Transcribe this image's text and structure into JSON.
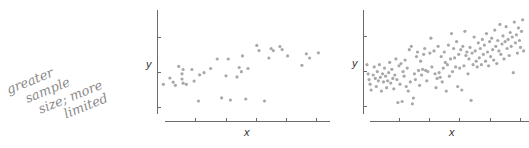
{
  "annotation": {
    "lines": [
      "greater",
      "sample",
      "size; more",
      "limited"
    ],
    "color": "#8a8a8a"
  },
  "point_color": "#a8a8a8",
  "axis_color": "#6b6b6b",
  "chart_data": [
    {
      "type": "scatter",
      "title": "",
      "xlabel": "x",
      "ylabel": "y",
      "grid": false,
      "legend": "none",
      "description": "smaller sample, weak positive relationship",
      "x_ticks": 5,
      "y_ticks": 3,
      "xlim": [
        0,
        10
      ],
      "ylim": [
        0,
        10
      ],
      "points": [
        [
          0.3,
          3.5
        ],
        [
          0.9,
          4.1
        ],
        [
          1.2,
          3.7
        ],
        [
          1.4,
          3.4
        ],
        [
          1.7,
          5.2
        ],
        [
          2.0,
          4.0
        ],
        [
          2.0,
          4.5
        ],
        [
          2.1,
          3.6
        ],
        [
          2.1,
          4.9
        ],
        [
          2.4,
          3.5
        ],
        [
          2.9,
          4.9
        ],
        [
          3.1,
          3.8
        ],
        [
          3.5,
          1.9
        ],
        [
          3.6,
          4.4
        ],
        [
          4.0,
          4.6
        ],
        [
          4.6,
          5.0
        ],
        [
          5.2,
          5.9
        ],
        [
          5.6,
          2.2
        ],
        [
          6.0,
          4.3
        ],
        [
          6.2,
          5.9
        ],
        [
          6.4,
          2.0
        ],
        [
          7.0,
          4.2
        ],
        [
          7.2,
          5.1
        ],
        [
          7.4,
          4.7
        ],
        [
          7.5,
          6.2
        ],
        [
          7.8,
          2.1
        ],
        [
          8.0,
          5.0
        ],
        [
          8.8,
          7.2
        ],
        [
          9.0,
          6.7
        ],
        [
          9.5,
          1.9
        ],
        [
          9.9,
          6.0
        ],
        [
          10.1,
          6.9
        ],
        [
          10.3,
          6.7
        ],
        [
          10.9,
          7.1
        ],
        [
          11.1,
          6.8
        ],
        [
          11.6,
          6.2
        ],
        [
          12.9,
          5.3
        ],
        [
          13.3,
          6.4
        ],
        [
          13.6,
          6.0
        ],
        [
          14.4,
          6.5
        ]
      ]
    },
    {
      "type": "scatter",
      "title": "",
      "xlabel": "x",
      "ylabel": "y",
      "grid": false,
      "legend": "none",
      "description": "larger sample, clearer positive relationship",
      "x_ticks": 5,
      "y_ticks": 3,
      "xlim": [
        0,
        10
      ],
      "ylim": [
        0,
        10
      ],
      "points": [
        [
          0.1,
          4.9
        ],
        [
          0.2,
          4.1
        ],
        [
          0.3,
          3.6
        ],
        [
          0.4,
          3.2
        ],
        [
          0.5,
          2.7
        ],
        [
          0.7,
          4.0
        ],
        [
          0.8,
          4.7
        ],
        [
          0.9,
          3.7
        ],
        [
          1.0,
          3.0
        ],
        [
          1.1,
          4.3
        ],
        [
          1.2,
          3.5
        ],
        [
          1.3,
          4.9
        ],
        [
          1.4,
          3.8
        ],
        [
          1.5,
          2.6
        ],
        [
          1.6,
          4.1
        ],
        [
          1.7,
          3.4
        ],
        [
          1.8,
          4.6
        ],
        [
          1.9,
          3.9
        ],
        [
          2.0,
          2.9
        ],
        [
          2.1,
          3.5
        ],
        [
          2.2,
          4.2
        ],
        [
          2.3,
          5.1
        ],
        [
          2.4,
          3.3
        ],
        [
          2.5,
          4.5
        ],
        [
          2.6,
          3.7
        ],
        [
          2.7,
          2.8
        ],
        [
          2.8,
          4.0
        ],
        [
          2.9,
          5.4
        ],
        [
          3.0,
          3.6
        ],
        [
          3.1,
          1.6
        ],
        [
          3.2,
          4.8
        ],
        [
          3.3,
          3.2
        ],
        [
          3.4,
          5.0
        ],
        [
          3.5,
          1.7
        ],
        [
          3.6,
          4.3
        ],
        [
          3.7,
          3.9
        ],
        [
          3.8,
          5.3
        ],
        [
          3.9,
          3.0
        ],
        [
          4.0,
          4.6
        ],
        [
          4.1,
          2.6
        ],
        [
          4.2,
          6.2
        ],
        [
          4.3,
          3.4
        ],
        [
          4.4,
          6.5
        ],
        [
          4.5,
          1.5
        ],
        [
          4.6,
          2.0
        ],
        [
          4.7,
          4.1
        ],
        [
          4.8,
          3.6
        ],
        [
          4.9,
          5.6
        ],
        [
          5.0,
          6.0
        ],
        [
          5.1,
          4.4
        ],
        [
          5.2,
          3.1
        ],
        [
          5.3,
          5.2
        ],
        [
          5.4,
          4.0
        ],
        [
          5.5,
          4.5
        ],
        [
          5.6,
          5.8
        ],
        [
          5.7,
          6.3
        ],
        [
          5.8,
          4.4
        ],
        [
          5.9,
          3.5
        ],
        [
          6.0,
          4.3
        ],
        [
          6.2,
          5.9
        ],
        [
          6.3,
          7.2
        ],
        [
          6.4,
          4.7
        ],
        [
          6.6,
          6.1
        ],
        [
          6.7,
          4.1
        ],
        [
          6.8,
          2.9
        ],
        [
          6.9,
          3.7
        ],
        [
          7.0,
          6.5
        ],
        [
          7.1,
          4.2
        ],
        [
          7.2,
          3.8
        ],
        [
          7.3,
          5.6
        ],
        [
          7.4,
          3.4
        ],
        [
          7.5,
          4.6
        ],
        [
          7.6,
          6.0
        ],
        [
          7.7,
          5.1
        ],
        [
          7.8,
          2.6
        ],
        [
          7.9,
          4.9
        ],
        [
          8.0,
          6.6
        ],
        [
          8.1,
          3.9
        ],
        [
          8.2,
          5.4
        ],
        [
          8.3,
          7.6
        ],
        [
          8.4,
          4.3
        ],
        [
          8.5,
          6.3
        ],
        [
          8.6,
          5.5
        ],
        [
          8.7,
          4.7
        ],
        [
          8.8,
          6.9
        ],
        [
          8.9,
          3.0
        ],
        [
          9.0,
          5.8
        ],
        [
          9.1,
          4.6
        ],
        [
          9.2,
          6.2
        ],
        [
          9.3,
          2.7
        ],
        [
          9.4,
          6.5
        ],
        [
          9.5,
          4.8
        ],
        [
          9.6,
          7.8
        ],
        [
          9.7,
          5.7
        ],
        [
          9.8,
          6.0
        ],
        [
          9.9,
          4.1
        ],
        [
          10.0,
          5.4
        ],
        [
          10.1,
          6.4
        ],
        [
          10.2,
          1.8
        ],
        [
          10.3,
          5.9
        ],
        [
          10.4,
          4.9
        ],
        [
          10.5,
          7.3
        ],
        [
          10.6,
          6.1
        ],
        [
          10.7,
          5.2
        ],
        [
          10.8,
          4.7
        ],
        [
          10.9,
          6.8
        ],
        [
          11.0,
          5.5
        ],
        [
          11.1,
          6.3
        ],
        [
          11.2,
          4.9
        ],
        [
          11.3,
          7.1
        ],
        [
          11.4,
          5.8
        ],
        [
          11.5,
          6.6
        ],
        [
          11.6,
          5.2
        ],
        [
          11.7,
          7.6
        ],
        [
          11.8,
          6.0
        ],
        [
          11.9,
          4.8
        ],
        [
          12.0,
          6.9
        ],
        [
          12.1,
          5.6
        ],
        [
          12.2,
          7.2
        ],
        [
          12.3,
          6.2
        ],
        [
          12.4,
          5.3
        ],
        [
          12.5,
          7.9
        ],
        [
          12.6,
          6.5
        ],
        [
          12.7,
          5.0
        ],
        [
          12.8,
          7.0
        ],
        [
          12.9,
          6.1
        ],
        [
          13.0,
          8.4
        ],
        [
          13.1,
          5.8
        ],
        [
          13.2,
          6.7
        ],
        [
          13.3,
          7.4
        ],
        [
          13.4,
          5.4
        ],
        [
          13.5,
          6.9
        ],
        [
          13.6,
          8.2
        ],
        [
          13.7,
          6.3
        ],
        [
          13.8,
          7.1
        ],
        [
          13.9,
          5.7
        ],
        [
          14.0,
          7.7
        ],
        [
          14.1,
          6.5
        ],
        [
          14.2,
          7.3
        ],
        [
          14.3,
          4.2
        ],
        [
          14.4,
          8.6
        ],
        [
          14.5,
          6.8
        ],
        [
          14.6,
          7.5
        ],
        [
          14.7,
          5.9
        ],
        [
          14.8,
          8.1
        ],
        [
          14.9,
          7.0
        ],
        [
          15.0,
          6.4
        ],
        [
          15.1,
          7.8
        ],
        [
          15.2,
          8.8
        ],
        [
          15.3,
          6.1
        ]
      ]
    }
  ]
}
